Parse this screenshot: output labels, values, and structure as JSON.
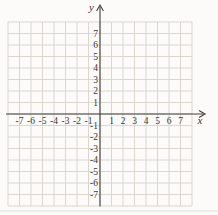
{
  "colors": {
    "background": "#fcfbf9",
    "grid_line": "#d7d3ca",
    "axis": "#403f3d",
    "label_text": "#3a3835",
    "page_edge_line": "#e0ddd5"
  },
  "chart_data": {
    "type": "scatter",
    "title": "",
    "points": [],
    "grid": true,
    "legend": false,
    "x_axis": {
      "label": "x",
      "min": -8,
      "max": 8,
      "tick_labels": [
        -7,
        -6,
        -5,
        -4,
        -3,
        -2,
        -1,
        1,
        2,
        3,
        4,
        5,
        6,
        7
      ]
    },
    "y_axis": {
      "label": "y",
      "min": -8,
      "max": 8,
      "tick_labels": [
        7,
        6,
        5,
        4,
        3,
        2,
        1,
        -1,
        -2,
        -3,
        -4,
        -5,
        -6,
        -7
      ]
    }
  }
}
